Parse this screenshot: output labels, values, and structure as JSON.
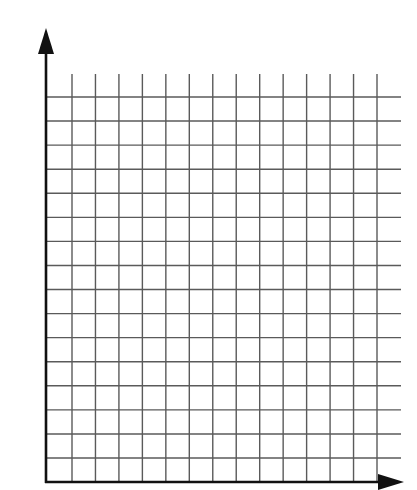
{
  "diagram": {
    "type": "blank-coordinate-grid",
    "vertical_grid_lines": 14,
    "horizontal_grid_lines": 16,
    "axis_color": "#111111",
    "grid_color": "#5a5a5a",
    "background_color": "#ffffff",
    "labels": []
  }
}
